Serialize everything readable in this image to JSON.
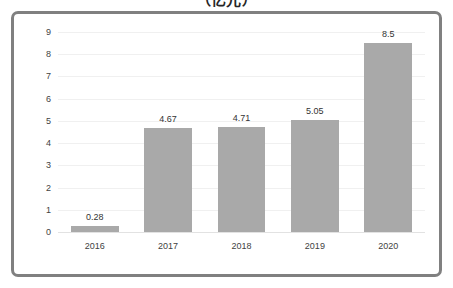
{
  "chart_data": {
    "type": "bar",
    "title": "（亿元）",
    "subtitle": "",
    "xlabel": "",
    "ylabel": "",
    "categories": [
      "2016",
      "2017",
      "2018",
      "2019",
      "2020"
    ],
    "values": [
      0.28,
      4.67,
      4.71,
      5.05,
      8.5
    ],
    "value_labels": [
      "0.28",
      "4.67",
      "4.71",
      "5.05",
      "8.5"
    ],
    "ylim": [
      0,
      9
    ],
    "yticks": [
      0,
      1,
      2,
      3,
      4,
      5,
      6,
      7,
      8,
      9
    ],
    "ytick_labels": [
      "0",
      "1",
      "2",
      "3",
      "4",
      "5",
      "6",
      "7",
      "8",
      "9"
    ],
    "grid": true,
    "legend": "none",
    "series": [
      {
        "name": "",
        "values": [
          0.28,
          4.67,
          4.71,
          5.05,
          8.5
        ],
        "color": "#a9a9a9"
      }
    ],
    "colors": {
      "bar": "#a9a9a9",
      "frame": "#808080",
      "gridline": "#f0f0f0",
      "baseline": "#e2e2e2",
      "text": "#3f3f3f",
      "background": "#ffffff"
    }
  }
}
